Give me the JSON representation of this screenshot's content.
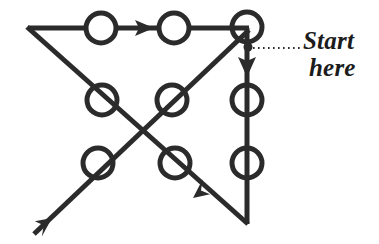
{
  "diagram": {
    "type": "directed-graph-path",
    "annotation": {
      "line1": "Start",
      "line2": "here",
      "leader_style": "dotted",
      "leader_from_x": 252,
      "leader_to_x": 300,
      "leader_y": 48
    },
    "colors": {
      "background": "#ffffff",
      "stroke": "#2b2b2b",
      "node_fill": "#ffffff",
      "text": "#1c1c1c"
    },
    "stroke_width": 5,
    "node_radius": 15,
    "node_stroke_width": 5,
    "nodes": [
      {
        "id": "n1",
        "cx": 101,
        "cy": 28,
        "label": ""
      },
      {
        "id": "n2",
        "cx": 174,
        "cy": 28,
        "label": ""
      },
      {
        "id": "n3",
        "cx": 247,
        "cy": 27,
        "label": ""
      },
      {
        "id": "n4",
        "cx": 102,
        "cy": 100,
        "label": ""
      },
      {
        "id": "n5",
        "cx": 172,
        "cy": 100,
        "label": ""
      },
      {
        "id": "n6",
        "cx": 247,
        "cy": 100,
        "label": ""
      },
      {
        "id": "n7",
        "cx": 98,
        "cy": 163,
        "label": ""
      },
      {
        "id": "n8",
        "cx": 175,
        "cy": 163,
        "label": ""
      },
      {
        "id": "n9",
        "cx": 247,
        "cy": 163,
        "label": ""
      }
    ],
    "edges": [
      {
        "id": "e-top",
        "x1": 28,
        "y1": 28,
        "x2": 247,
        "y2": 28,
        "arrow_at": 0.57,
        "direction": "right"
      },
      {
        "id": "e-right",
        "x1": 247,
        "y1": 31,
        "x2": 247,
        "y2": 222,
        "arrow_at": 0.175,
        "direction": "down"
      },
      {
        "id": "e-diag-down",
        "x1": 28,
        "y1": 28,
        "x2": 247,
        "y2": 222,
        "arrow_at": 1.0,
        "direction": "down-right"
      },
      {
        "id": "e-diag-up",
        "x1": 37,
        "y1": 232,
        "x2": 247,
        "y2": 31,
        "arrow_at": 0.0,
        "direction": "down-left"
      }
    ],
    "arrowheads": [
      {
        "id": "a-top",
        "tip_x": 153,
        "tip_y": 28,
        "angle_deg": 0
      },
      {
        "id": "a-right",
        "tip_x": 247,
        "tip_y": 75,
        "angle_deg": 90
      },
      {
        "id": "a-bottom",
        "tip_x": 196,
        "tip_y": 196,
        "angle_deg": 224
      },
      {
        "id": "a-left",
        "tip_x": 54,
        "tip_y": 216,
        "angle_deg": 136
      }
    ],
    "start_marker": {
      "cx": 248,
      "cy": 48,
      "r": 4
    }
  }
}
